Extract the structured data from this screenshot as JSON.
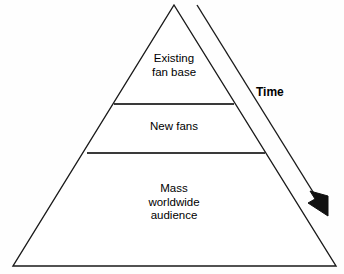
{
  "diagram": {
    "type": "pyramid",
    "title": "",
    "background_color": "#fefefe",
    "line_color": "#1a1a1a",
    "text_color": "#000000",
    "tiers": [
      {
        "id": "top",
        "label": "Existing\nfan base",
        "lines": [
          "Existing",
          "fan base"
        ],
        "order": 1
      },
      {
        "id": "middle",
        "label": "New fans",
        "lines": [
          "New fans"
        ],
        "order": 2
      },
      {
        "id": "bottom",
        "label": "Mass\nworldwide\naudience",
        "lines": [
          "Mass",
          "worldwide",
          "audience"
        ],
        "order": 3
      }
    ],
    "annotation": {
      "id": "time-arrow",
      "label": "Time",
      "direction": "downward",
      "bold": true
    }
  }
}
